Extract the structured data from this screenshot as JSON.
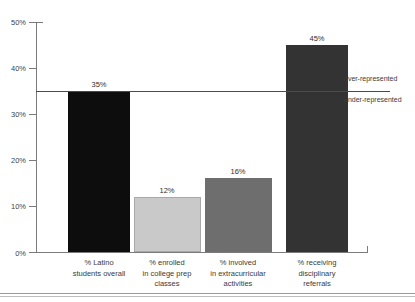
{
  "clipped_heading": "% of total Latino",
  "chart_data": {
    "type": "bar",
    "title": "",
    "subtitle": "",
    "xlabel": "",
    "ylabel": "",
    "ylim": [
      0,
      50
    ],
    "grid": false,
    "legend_position": "none",
    "categories": [
      "% Latino\nstudents overall",
      "% enrolled\nin college prep\nclasses",
      "% involved\nin extracurricular\nactivities",
      "% receiving\ndisciplinary\nreferrals"
    ],
    "values": [
      35,
      12,
      16,
      45
    ],
    "value_labels": [
      "35%",
      "12%",
      "16%",
      "45%"
    ],
    "bar_colors": [
      "#0d0d0d",
      "#c9c9c9",
      "#6e6e6e",
      "#333333"
    ],
    "y_ticks": [
      0,
      10,
      20,
      30,
      40,
      50
    ],
    "y_tick_labels": [
      "0%",
      "10%",
      "20%",
      "30%",
      "40%",
      "50%"
    ],
    "annotations": [
      {
        "name": "reference-line",
        "value": 35,
        "label": ""
      },
      {
        "name": "over-represented",
        "value": 35,
        "label": "over-represented"
      },
      {
        "name": "under-represented",
        "value": 35,
        "label": "under-represented"
      }
    ]
  }
}
